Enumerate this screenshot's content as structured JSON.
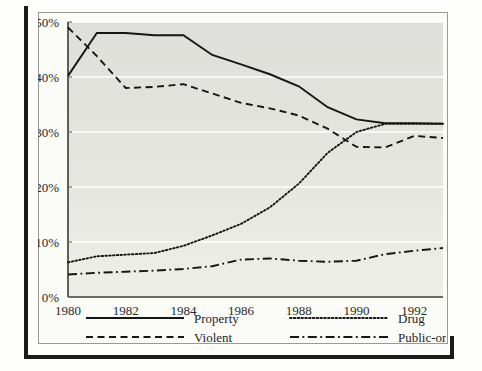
{
  "chart_data": {
    "type": "line",
    "title": "",
    "subtitle": "",
    "xlabel": "",
    "ylabel": "",
    "x": [
      1980,
      1981,
      1982,
      1983,
      1984,
      1985,
      1986,
      1987,
      1988,
      1989,
      1990,
      1991,
      1992,
      1993
    ],
    "xlim": [
      1980,
      1993
    ],
    "ylim": [
      0,
      50
    ],
    "x_ticks": [
      1980,
      1982,
      1984,
      1986,
      1988,
      1990,
      1992
    ],
    "x_tick_labels": [
      "1980",
      "1982",
      "1984",
      "1986",
      "1988",
      "1990",
      "1992"
    ],
    "y_ticks": [
      0,
      10,
      20,
      30,
      40,
      50
    ],
    "y_tick_labels": [
      "0%",
      "10%",
      "20%",
      "30%",
      "40%",
      "50%"
    ],
    "grid": true,
    "grid_axis": "y",
    "legend_position": "below-plot",
    "series": [
      {
        "name": "Property",
        "line_style": "solid",
        "color": "#161616",
        "values": [
          40.2,
          48.0,
          48.0,
          47.6,
          47.6,
          44.0,
          42.3,
          40.5,
          38.3,
          34.5,
          32.3,
          31.6,
          31.6,
          31.5
        ]
      },
      {
        "name": "Violent",
        "line_style": "dashed",
        "color": "#161616",
        "values": [
          49.0,
          43.8,
          38.0,
          38.2,
          38.7,
          37.0,
          35.3,
          34.3,
          33.0,
          30.6,
          27.3,
          27.2,
          29.3,
          28.9
        ]
      },
      {
        "name": "Drug",
        "line_style": "dotted",
        "color": "#161616",
        "values": [
          6.3,
          7.4,
          7.7,
          8.0,
          9.3,
          11.2,
          13.3,
          16.3,
          20.6,
          26.2,
          30.0,
          31.5,
          31.5,
          31.5
        ]
      },
      {
        "name": "Public-order",
        "line_style": "dash-dot",
        "color": "#161616",
        "values": [
          4.1,
          4.4,
          4.6,
          4.8,
          5.1,
          5.6,
          6.8,
          7.0,
          6.6,
          6.4,
          6.6,
          7.8,
          8.4,
          8.9
        ]
      }
    ]
  },
  "legend": {
    "items": [
      {
        "label": "Property",
        "style": "solid"
      },
      {
        "label": "Drug",
        "style": "dotted"
      },
      {
        "label": "Violent",
        "style": "dashed"
      },
      {
        "label": "Public-order",
        "style": "dash-dot"
      }
    ]
  },
  "colors": {
    "ink": "#161616",
    "plot_background": "#e2e2dd",
    "page_background": "#fbfbf8",
    "gridline": "#ffffff",
    "frame": "#1b1b1b"
  }
}
